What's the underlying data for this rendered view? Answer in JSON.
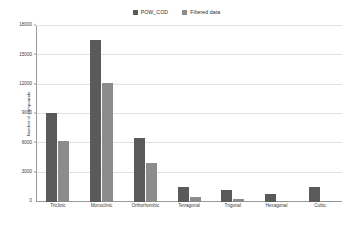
{
  "chart_data": {
    "type": "bar",
    "title": "",
    "xlabel": "",
    "ylabel": "Number of compounds",
    "categories": [
      "Triclinic",
      "Monoclinic",
      "Orthorhombic",
      "Tetragonal",
      "Trigonal",
      "Hexagonal",
      "Cubic"
    ],
    "series": [
      {
        "name": "POW_COD",
        "color": "#5a5a5a",
        "values": [
          9150,
          16550,
          6500,
          1550,
          1200,
          800,
          1530
        ]
      },
      {
        "name": "Filtered data",
        "color": "#8c8c8c",
        "values": [
          6200,
          12200,
          3950,
          520,
          350,
          110,
          140
        ]
      }
    ],
    "ylim": [
      0,
      18000
    ],
    "yticks": [
      3000,
      6000,
      9000,
      12000,
      15000,
      18000
    ],
    "ytick_labels": [
      "3000",
      "6000",
      "9000",
      "12000",
      "15000",
      "18000"
    ],
    "zero_label": "0",
    "grid": true,
    "legend_position": "top-center"
  }
}
